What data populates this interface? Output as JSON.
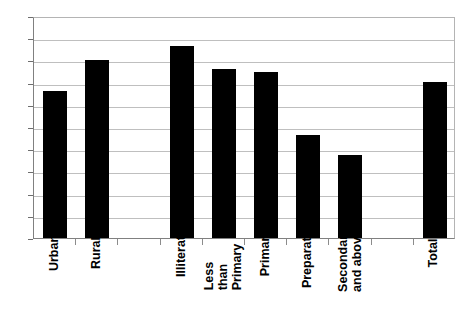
{
  "chart_data": {
    "type": "bar",
    "title": "",
    "subtitle": "",
    "xlabel": "",
    "ylabel": "",
    "ylim": [
      0,
      10
    ],
    "ytick_step": 1,
    "grid": true,
    "legend": false,
    "legend_position": "none",
    "bar_color": "#000000",
    "background_color": "#ffffff",
    "gridline_color": "#bfbfbf",
    "axis_color": "#808080",
    "xlabel_rotation_degrees": -90,
    "slots": [
      {
        "category": "Urban",
        "value": 6.6,
        "lines": [
          "Urban"
        ],
        "empty": false
      },
      {
        "category": "Rural",
        "value": 8.0,
        "lines": [
          "Rural"
        ],
        "empty": false
      },
      {
        "category": "",
        "value": null,
        "lines": [],
        "empty": true
      },
      {
        "category": "Illiterate",
        "value": 8.65,
        "lines": [
          "Illiterate"
        ],
        "empty": false
      },
      {
        "category": "Less than Primary",
        "value": 7.6,
        "lines": [
          "Less than",
          "Primary"
        ],
        "empty": false
      },
      {
        "category": "Primary",
        "value": 7.5,
        "lines": [
          "Primary"
        ],
        "empty": false
      },
      {
        "category": "Preparatory",
        "value": 4.65,
        "lines": [
          "Preparatory"
        ],
        "empty": false
      },
      {
        "category": "Secondary and above",
        "value": 3.75,
        "lines": [
          "Secondary",
          "and above"
        ],
        "empty": false
      },
      {
        "category": "",
        "value": null,
        "lines": [],
        "empty": true
      },
      {
        "category": "Total",
        "value": 7.05,
        "lines": [
          "Total"
        ],
        "empty": false
      }
    ],
    "categories": [
      "Urban",
      "Rural",
      "Illiterate",
      "Less than Primary",
      "Primary",
      "Preparatory",
      "Secondary and above",
      "Total"
    ],
    "values": [
      6.6,
      8.0,
      8.65,
      7.6,
      7.5,
      4.65,
      3.75,
      7.05
    ],
    "ytick_labels": [
      "10",
      "9",
      "8",
      "7",
      "6",
      "5",
      "4",
      "3",
      "2",
      "1",
      "0"
    ]
  }
}
